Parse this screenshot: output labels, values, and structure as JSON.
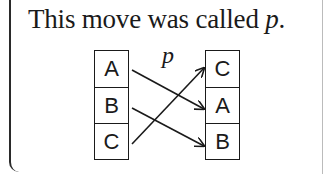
{
  "caption": {
    "text": "This move was called ",
    "symbol": "p",
    "end": "."
  },
  "diagram": {
    "move_label": "p",
    "left_column": [
      "A",
      "B",
      "C"
    ],
    "right_column": [
      "C",
      "A",
      "B"
    ],
    "arrows": [
      {
        "from": "A",
        "to": "A"
      },
      {
        "from": "B",
        "to": "B"
      },
      {
        "from": "C",
        "to": "C"
      }
    ]
  }
}
